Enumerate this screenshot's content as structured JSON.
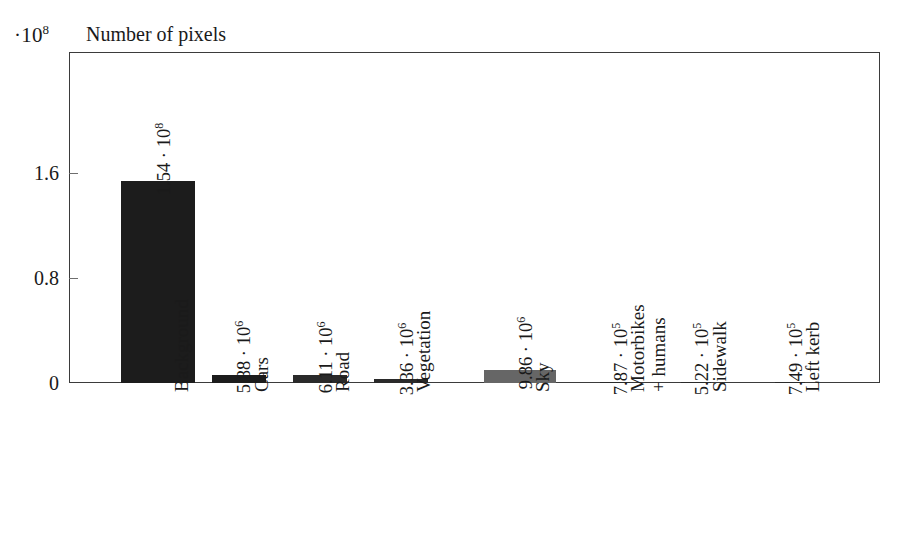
{
  "header": {
    "y_exponent_prefix": "·10",
    "y_exponent_power": "8",
    "title": "Number of pixels"
  },
  "axes": {
    "y_ticks": [
      "0",
      "0.8",
      "1.6"
    ],
    "y_tick_values": [
      0,
      0.8,
      1.6
    ],
    "y_unit_exponent": "10^8",
    "ylim": [
      0,
      2.0
    ],
    "grid": false
  },
  "colors": {
    "bar_dark": "#1c1c1c",
    "bar_gray": "#666666",
    "frame": "#3b3b3b",
    "text": "#1a1a1a",
    "background": "#ffffff"
  },
  "chart_data": {
    "type": "bar",
    "title": "Number of pixels",
    "xlabel": "",
    "ylabel": "Number of pixels",
    "ylim": [
      0,
      2.0
    ],
    "y_axis_exponent": "1e8",
    "grid": false,
    "legend": "none",
    "categories": [
      "Background",
      "Cars",
      "Road",
      "Vegetation",
      "Sky",
      "Motorbikes + humans",
      "Sidewalk",
      "Left kerb"
    ],
    "category_lines": [
      [
        "Background"
      ],
      [
        "Cars"
      ],
      [
        "Road"
      ],
      [
        "Vegetation"
      ],
      [
        "Sky"
      ],
      [
        "Motorbikes",
        "+ humans"
      ],
      [
        "Sidewalk"
      ],
      [
        "Left kerb"
      ]
    ],
    "values": [
      154000000,
      5880000,
      6110000,
      3360000,
      9860000,
      787000,
      522000,
      749000
    ],
    "values_scaled_1e8": [
      1.54,
      0.0588,
      0.0611,
      0.0336,
      0.0986,
      0.00787,
      0.00522,
      0.00749
    ],
    "value_labels": [
      {
        "mantissa": "1.54 · 10",
        "exponent": "8"
      },
      {
        "mantissa": "5.88 · 10",
        "exponent": "6"
      },
      {
        "mantissa": "6.11 · 10",
        "exponent": "6"
      },
      {
        "mantissa": "3.36 · 10",
        "exponent": "6"
      },
      {
        "mantissa": "9.86 · 10",
        "exponent": "6"
      },
      {
        "mantissa": "7.87 · 10",
        "exponent": "5"
      },
      {
        "mantissa": "5.22 · 10",
        "exponent": "5"
      },
      {
        "mantissa": "7.49 · 10",
        "exponent": "5"
      }
    ],
    "bar_colors": [
      "#1c1c1c",
      "#1c1c1c",
      "#2a2a2a",
      "#2a2a2a",
      "#666666",
      "#2a2a2a",
      "#2a2a2a",
      "#2a2a2a"
    ]
  },
  "geometry": {
    "plot_left": 69,
    "plot_right": 880,
    "plot_top": 52,
    "baseline_y": 383,
    "y_tick_px": [
      383,
      278,
      173
    ],
    "bar_centers_x": [
      158,
      239,
      320,
      401,
      520,
      615,
      696,
      790
    ],
    "bar_widths": [
      74,
      54,
      54,
      54,
      72,
      30,
      30,
      30
    ],
    "value_label_x": [
      175,
      255,
      337,
      418,
      537,
      632,
      713,
      807
    ],
    "value_label_baseline_y": [
      172,
      370,
      370,
      372,
      366,
      372,
      372,
      372
    ],
    "cat_label_x": [
      172,
      252,
      333,
      414,
      533,
      628,
      710,
      803
    ],
    "cat_label_top_y": [
      392,
      392,
      392,
      392,
      392,
      392,
      392,
      392
    ]
  }
}
